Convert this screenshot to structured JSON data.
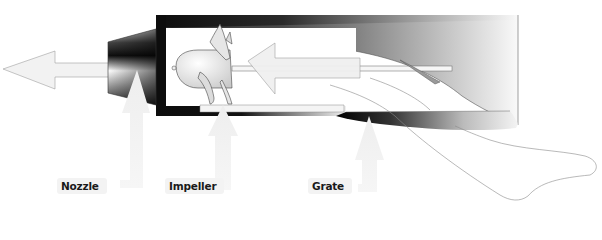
{
  "diagram": {
    "labels": [
      {
        "id": "nozzle",
        "text": "Nozzle"
      },
      {
        "id": "impeller",
        "text": "Impeller"
      },
      {
        "id": "grate",
        "text": "Grate"
      }
    ],
    "flow_direction": "right-to-left",
    "colors": {
      "background": "#ffffff",
      "arrow_fill": "#f1f1f1",
      "arrow_stroke": "#9a9a9a",
      "housing_dark": "#111111",
      "housing_light": "#f4f4f4",
      "label_text": "#1a1a1a",
      "label_bg": "#f3f3f3"
    }
  }
}
